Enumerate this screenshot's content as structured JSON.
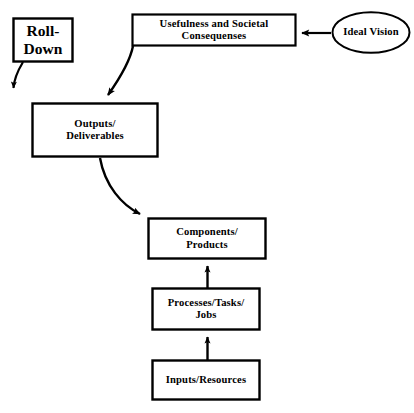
{
  "diagram": {
    "type": "flow-diagram",
    "background_color": "#ffffff",
    "stroke_color": "#000000",
    "nodes": [
      {
        "id": "roll-down",
        "shape": "rectangle",
        "label": "Roll-\nDown",
        "x": 13,
        "y": 18,
        "width": 60,
        "height": 44
      },
      {
        "id": "usefulness",
        "shape": "rectangle",
        "label": "Usefulness and Societal\nConsequenses",
        "x": 132,
        "y": 14,
        "width": 164,
        "height": 32
      },
      {
        "id": "ideal-vision",
        "shape": "ellipse",
        "label": "Ideal Vision",
        "x": 332,
        "y": 12,
        "width": 78,
        "height": 41
      },
      {
        "id": "outputs",
        "shape": "rectangle",
        "label": "Outputs/\nDeliverables",
        "x": 32,
        "y": 103,
        "width": 126,
        "height": 54
      },
      {
        "id": "components",
        "shape": "rectangle",
        "label": "Components/\nProducts",
        "x": 148,
        "y": 218,
        "width": 118,
        "height": 41
      },
      {
        "id": "processes",
        "shape": "rectangle",
        "label": "Processes/Tasks/\nJobs",
        "x": 152,
        "y": 288,
        "width": 108,
        "height": 42
      },
      {
        "id": "inputs",
        "shape": "rectangle",
        "label": "Inputs/Resources",
        "x": 152,
        "y": 360,
        "width": 108,
        "height": 40
      }
    ],
    "edges": [
      {
        "id": "ideal-vision-to-usefulness",
        "from": "ideal-vision",
        "to": "usefulness",
        "style": "straight",
        "direction": "left"
      },
      {
        "id": "usefulness-to-outputs",
        "from": "usefulness",
        "to": "outputs",
        "style": "curved",
        "direction": "down-left"
      },
      {
        "id": "roll-down-arrow",
        "from": "roll-down",
        "to": "",
        "style": "curved",
        "direction": "down"
      },
      {
        "id": "outputs-to-components",
        "from": "outputs",
        "to": "components",
        "style": "curved",
        "direction": "down-right"
      },
      {
        "id": "processes-to-components",
        "from": "processes",
        "to": "components",
        "style": "straight",
        "direction": "up"
      },
      {
        "id": "inputs-to-processes",
        "from": "inputs",
        "to": "processes",
        "style": "straight",
        "direction": "up"
      }
    ]
  }
}
